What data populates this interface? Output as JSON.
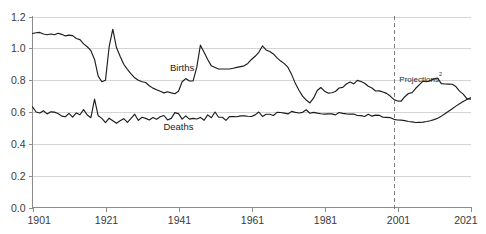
{
  "chart_data": {
    "type": "line",
    "title": "",
    "xlabel": "",
    "ylabel": "",
    "xlim": [
      1901,
      2021
    ],
    "ylim": [
      0.0,
      1.2
    ],
    "grid": true,
    "legend": "inline-annotations",
    "x_ticks": [
      "1901",
      "1921",
      "1941",
      "1961",
      "1981",
      "2001",
      "2021"
    ],
    "x_tick_values": [
      1901,
      1921,
      1941,
      1961,
      1981,
      2001,
      2021
    ],
    "y_ticks": [
      "0.0",
      "0.2",
      "0.4",
      "0.6",
      "0.8",
      "1.0",
      "1.2"
    ],
    "y_tick_values": [
      0.0,
      0.2,
      0.4,
      0.6,
      0.8,
      1.0,
      1.2
    ],
    "annotations": [
      {
        "id": "births-label",
        "text": "Births",
        "x": 1942,
        "y": 0.855
      },
      {
        "id": "deaths-label",
        "text": "Deaths",
        "x": 1941,
        "y": 0.49
      },
      {
        "id": "projections-label",
        "text": "Projections",
        "superscript": "2",
        "x": 2001.5,
        "y": 0.79
      }
    ],
    "projection_divider": {
      "x": 2000,
      "label": "Projections",
      "style": "dashed"
    },
    "x": [
      1901,
      1902,
      1903,
      1904,
      1905,
      1906,
      1907,
      1908,
      1909,
      1910,
      1911,
      1912,
      1913,
      1914,
      1915,
      1916,
      1917,
      1918,
      1919,
      1920,
      1921,
      1922,
      1923,
      1924,
      1925,
      1926,
      1927,
      1928,
      1929,
      1930,
      1931,
      1932,
      1933,
      1934,
      1935,
      1936,
      1937,
      1938,
      1939,
      1940,
      1941,
      1942,
      1943,
      1944,
      1945,
      1946,
      1947,
      1948,
      1949,
      1950,
      1951,
      1952,
      1953,
      1954,
      1955,
      1956,
      1957,
      1958,
      1959,
      1960,
      1961,
      1962,
      1963,
      1964,
      1965,
      1966,
      1967,
      1968,
      1969,
      1970,
      1971,
      1972,
      1973,
      1974,
      1975,
      1976,
      1977,
      1978,
      1979,
      1980,
      1981,
      1982,
      1983,
      1984,
      1985,
      1986,
      1987,
      1988,
      1989,
      1990,
      1991,
      1992,
      1993,
      1994,
      1995,
      1996,
      1997,
      1998,
      1999,
      2000,
      2001,
      2002,
      2003,
      2004,
      2005,
      2006,
      2007,
      2008,
      2009,
      2010,
      2011,
      2012,
      2013,
      2014,
      2015,
      2016,
      2017,
      2018,
      2019,
      2020,
      2021
    ],
    "series": [
      {
        "name": "Births",
        "units": "millions per year",
        "values": [
          1.093,
          1.098,
          1.1,
          1.09,
          1.085,
          1.09,
          1.085,
          1.095,
          1.088,
          1.078,
          1.083,
          1.08,
          1.062,
          1.055,
          1.028,
          1.01,
          0.985,
          0.93,
          0.825,
          0.79,
          0.8,
          1.01,
          1.12,
          1.005,
          0.95,
          0.9,
          0.868,
          0.84,
          0.815,
          0.8,
          0.79,
          0.785,
          0.765,
          0.75,
          0.74,
          0.73,
          0.72,
          0.727,
          0.72,
          0.715,
          0.73,
          0.79,
          0.81,
          0.795,
          0.795,
          0.88,
          1.02,
          0.975,
          0.93,
          0.89,
          0.88,
          0.87,
          0.87,
          0.87,
          0.87,
          0.875,
          0.88,
          0.885,
          0.89,
          0.905,
          0.93,
          0.95,
          0.975,
          1.015,
          0.99,
          0.98,
          0.965,
          0.94,
          0.92,
          0.904,
          0.88,
          0.835,
          0.78,
          0.737,
          0.7,
          0.675,
          0.657,
          0.687,
          0.735,
          0.754,
          0.731,
          0.719,
          0.721,
          0.729,
          0.751,
          0.755,
          0.776,
          0.788,
          0.777,
          0.799,
          0.792,
          0.781,
          0.762,
          0.751,
          0.732,
          0.733,
          0.726,
          0.717,
          0.7,
          0.679,
          0.669,
          0.668,
          0.696,
          0.716,
          0.722,
          0.749,
          0.772,
          0.794,
          0.79,
          0.797,
          0.808,
          0.813,
          0.778,
          0.776,
          0.775,
          0.774,
          0.76,
          0.731,
          0.712,
          0.684,
          0.681
        ]
      },
      {
        "name": "Deaths",
        "units": "millions per year",
        "values": [
          0.632,
          0.6,
          0.594,
          0.608,
          0.588,
          0.601,
          0.599,
          0.591,
          0.574,
          0.57,
          0.591,
          0.568,
          0.594,
          0.583,
          0.615,
          0.581,
          0.564,
          0.681,
          0.576,
          0.56,
          0.533,
          0.561,
          0.545,
          0.529,
          0.545,
          0.558,
          0.535,
          0.56,
          0.586,
          0.547,
          0.567,
          0.56,
          0.55,
          0.566,
          0.555,
          0.57,
          0.578,
          0.55,
          0.56,
          0.596,
          0.59,
          0.555,
          0.576,
          0.555,
          0.56,
          0.556,
          0.566,
          0.548,
          0.582,
          0.564,
          0.6,
          0.567,
          0.567,
          0.547,
          0.572,
          0.571,
          0.57,
          0.576,
          0.576,
          0.573,
          0.572,
          0.582,
          0.6,
          0.572,
          0.586,
          0.586,
          0.578,
          0.598,
          0.597,
          0.593,
          0.588,
          0.604,
          0.598,
          0.594,
          0.598,
          0.614,
          0.592,
          0.598,
          0.593,
          0.589,
          0.587,
          0.588,
          0.588,
          0.582,
          0.597,
          0.591,
          0.588,
          0.587,
          0.587,
          0.578,
          0.577,
          0.572,
          0.586,
          0.574,
          0.58,
          0.579,
          0.567,
          0.566,
          0.565,
          0.554,
          0.55,
          0.549,
          0.546,
          0.54,
          0.538,
          0.534,
          0.535,
          0.536,
          0.54,
          0.545,
          0.552,
          0.561,
          0.574,
          0.589,
          0.605,
          0.62,
          0.637,
          0.652,
          0.666,
          0.678,
          0.69
        ]
      }
    ]
  }
}
